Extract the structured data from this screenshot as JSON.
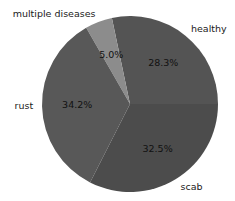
{
  "chart_data": {
    "type": "pie",
    "title": "",
    "categories": [
      "healthy",
      "multiple diseases",
      "rust",
      "scab"
    ],
    "values": [
      28.3,
      5.0,
      34.2,
      32.5
    ],
    "value_labels": [
      "28.3%",
      "5.0%",
      "34.2%",
      "32.5%"
    ],
    "colors": [
      "#545454",
      "#8c8c8c",
      "#585858",
      "#4c4c4c"
    ],
    "start_angle_deg": 0,
    "direction": "counterclockwise",
    "legend": "none (labels placed beside slices)"
  },
  "layout": {
    "center": [
      130,
      104
    ],
    "radius": 88
  }
}
